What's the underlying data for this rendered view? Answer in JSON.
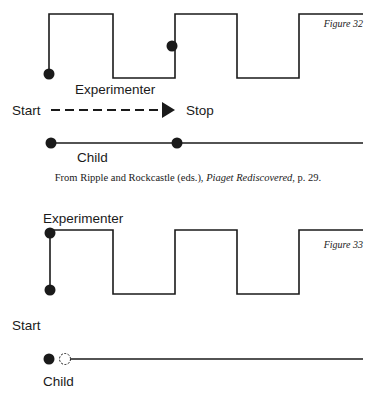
{
  "figure32": {
    "label": "Figure 32",
    "experimenter_label": "Experimenter",
    "start_label": "Start",
    "stop_label": "Stop",
    "child_label": "Child",
    "wave_path": "M49,74 L49,14 L113,14 L113,78 L175,78 L175,14 L237,14 L237,78 L299,78 L299,14 L363,14",
    "experimenter_dots": [
      {
        "x": 49,
        "y": 74
      },
      {
        "x": 172,
        "y": 46
      }
    ],
    "child_dots": [
      {
        "x": 51,
        "y": 143
      },
      {
        "x": 177,
        "y": 143
      }
    ]
  },
  "caption": {
    "prefix": "From Ripple and Rockcastle (eds.), ",
    "title": "Piaget Rediscovered",
    "suffix": ", p. 29."
  },
  "figure33": {
    "label": "Figure 33",
    "experimenter_label": "Experimenter",
    "start_label": "Start",
    "child_label": "Child",
    "wave_path": "M49,230 L113,230 L113,294 L175,294 L175,230 L237,230 L237,294 L299,294 L299,230 L363,230",
    "experimenter_dots": [
      {
        "x": 50,
        "y": 233
      },
      {
        "x": 50,
        "y": 290
      }
    ],
    "child_dots": [
      {
        "x": 49,
        "y": 359,
        "style": "filled"
      },
      {
        "x": 65,
        "y": 359,
        "style": "dashed"
      }
    ]
  }
}
